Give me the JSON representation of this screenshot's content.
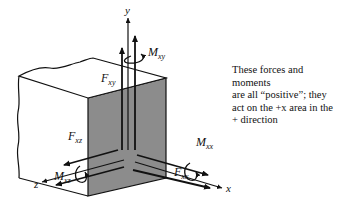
{
  "diagram": {
    "axes": {
      "x": "x",
      "y": "y",
      "z": "z"
    },
    "forces": {
      "Fxy": {
        "symbol": "F",
        "sub": "xy"
      },
      "Fxx": {
        "symbol": "F",
        "sub": "xx"
      },
      "Fxz": {
        "symbol": "F",
        "sub": "xz"
      }
    },
    "moments": {
      "Mxy": {
        "symbol": "M",
        "sub": "xy"
      },
      "Mxx": {
        "symbol": "M",
        "sub": "xx"
      },
      "Mxz": {
        "symbol": "M",
        "sub": "xz"
      }
    },
    "note_lines": [
      "These forces and moments",
      "are all “positive”; they",
      "act on the +x area in the",
      "+ direction"
    ],
    "colors": {
      "shaded_face": "#8c8c8c",
      "line": "#111111",
      "background": "#ffffff"
    }
  }
}
